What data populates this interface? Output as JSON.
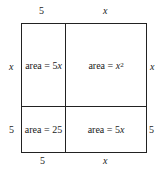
{
  "diagram": {
    "type": "area-model",
    "top_labels": [
      "5",
      "x"
    ],
    "bottom_labels": [
      "5",
      "x"
    ],
    "left_labels": [
      "x",
      "5"
    ],
    "right_labels": [
      "x",
      "5"
    ],
    "cells": {
      "top_left": {
        "prefix": "area = 5",
        "var": "x"
      },
      "top_right": {
        "prefix": "area = ",
        "var": "x",
        "exp": "2"
      },
      "bottom_left": {
        "text": "area = 25"
      },
      "bottom_right": {
        "prefix": "area = 5",
        "var": "x"
      }
    },
    "line_color": "#222222"
  }
}
